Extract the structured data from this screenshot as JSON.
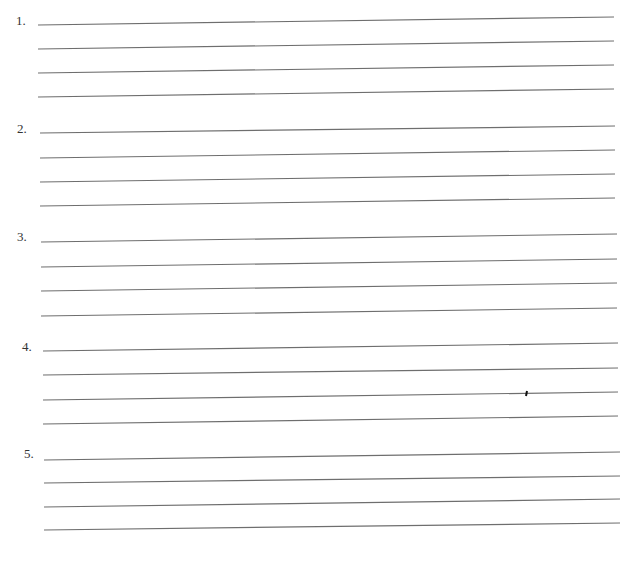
{
  "worksheet": {
    "items": [
      {
        "number": "1.",
        "num_x": 16,
        "num_y": 13,
        "lines": [
          [
            38,
            25,
            614,
            17
          ],
          [
            38,
            49,
            614,
            41
          ],
          [
            38,
            73,
            614,
            65
          ],
          [
            38,
            97,
            614,
            89
          ]
        ]
      },
      {
        "number": "2.",
        "num_x": 17,
        "num_y": 121,
        "lines": [
          [
            40,
            133,
            615,
            126
          ],
          [
            40,
            158,
            615,
            150
          ],
          [
            40,
            182,
            615,
            174
          ],
          [
            40,
            206,
            615,
            198
          ]
        ]
      },
      {
        "number": "3.",
        "num_x": 17,
        "num_y": 229,
        "lines": [
          [
            41,
            242,
            617,
            234
          ],
          [
            41,
            267,
            617,
            259
          ],
          [
            41,
            291,
            617,
            283
          ],
          [
            41,
            316,
            617,
            308
          ]
        ]
      },
      {
        "number": "4.",
        "num_x": 22,
        "num_y": 339,
        "lines": [
          [
            43,
            351,
            618,
            343
          ],
          [
            43,
            375,
            618,
            368
          ],
          [
            43,
            400,
            618,
            392
          ],
          [
            43,
            424,
            618,
            416
          ]
        ]
      },
      {
        "number": "5.",
        "num_x": 24,
        "num_y": 446,
        "lines": [
          [
            44,
            460,
            620,
            452
          ],
          [
            44,
            483,
            620,
            476
          ],
          [
            44,
            507,
            620,
            499
          ],
          [
            44,
            530,
            620,
            523
          ]
        ]
      }
    ],
    "stray_mark": {
      "x1": 527,
      "y1": 391,
      "x2": 526,
      "y2": 396
    },
    "line_color": "#6e6e6e"
  }
}
